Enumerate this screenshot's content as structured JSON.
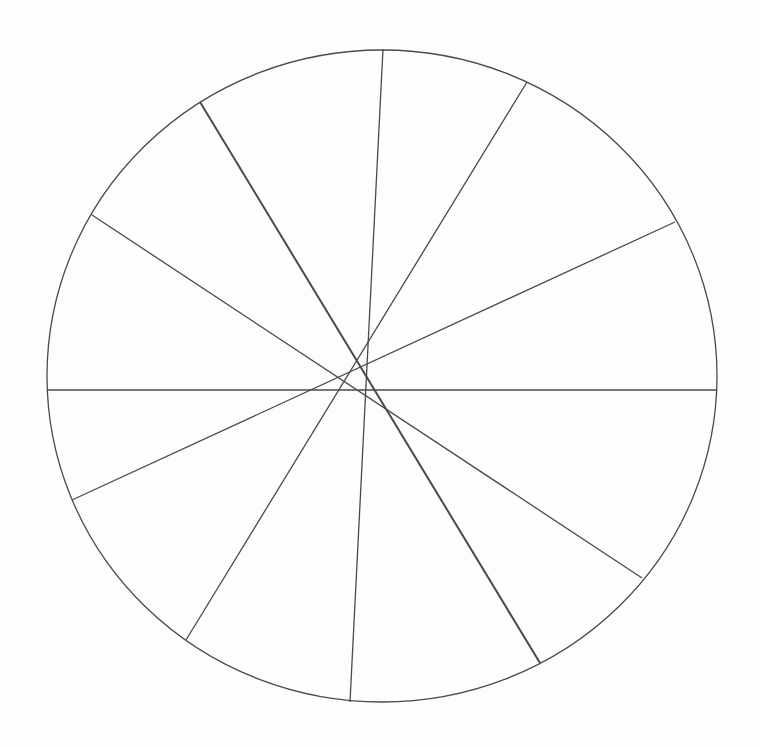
{
  "diagram": {
    "type": "circle-with-chords",
    "background": "#fdfdfd",
    "stroke_color": "#4a4a4a",
    "circle": {
      "cx": 382,
      "cy": 376,
      "rx": 335,
      "ry": 326
    },
    "chords": [
      {
        "id": "chord-near-vertical",
        "x1": 383,
        "y1": 49,
        "x2": 350,
        "y2": 702,
        "width": 1.3
      },
      {
        "id": "chord-steep-thick",
        "x1": 200,
        "y1": 102,
        "x2": 540,
        "y2": 663,
        "width": 2.0
      },
      {
        "id": "chord-steep-right",
        "x1": 527,
        "y1": 82,
        "x2": 186,
        "y2": 640,
        "width": 1.3
      },
      {
        "id": "chord-shallow-down",
        "x1": 92,
        "y1": 215,
        "x2": 642,
        "y2": 578,
        "width": 1.3
      },
      {
        "id": "chord-shallow-up",
        "x1": 675,
        "y1": 222,
        "x2": 72,
        "y2": 500,
        "width": 1.3
      },
      {
        "id": "chord-horizontal",
        "x1": 47,
        "y1": 390,
        "x2": 717,
        "y2": 390,
        "width": 1.3
      }
    ]
  }
}
